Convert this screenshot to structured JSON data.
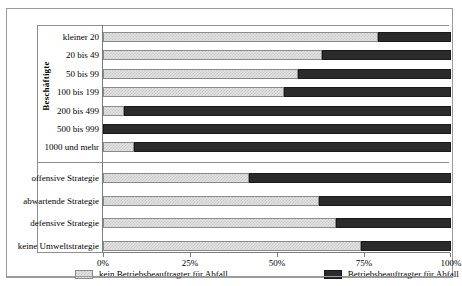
{
  "chart_data": {
    "type": "bar",
    "orientation": "horizontal",
    "stacked": true,
    "title": "",
    "xlabel": "",
    "ylabel": "Beschäftigte",
    "xlim": [
      0,
      100
    ],
    "xticks": [
      "0%",
      "25%",
      "50%",
      "75%",
      "100%"
    ],
    "xtick_values": [
      0,
      25,
      50,
      75,
      100
    ],
    "grid": false,
    "legend_position": "bottom",
    "categories": [
      "kleiner 20",
      "20 bis 49",
      "50 bis 99",
      "100 bis 199",
      "200 bis 499",
      "500 bis 999",
      "1000 und mehr",
      "offensive Strategie",
      "abwartende Strategie",
      "defensive Strategie",
      "keine Umweltstrategie"
    ],
    "group_labels": {
      "upper": "Beschäftigte",
      "lower": ""
    },
    "group_split_after_index": 6,
    "series": [
      {
        "name": "kein Betriebsbeauftragter für Abfall",
        "color": "#e2e2e2",
        "values": [
          79,
          63,
          56,
          52,
          6,
          0,
          9,
          42,
          62,
          67,
          74
        ]
      },
      {
        "name": "Betriebsbeauftragter für Abfall",
        "color": "#2b2b2b",
        "values": [
          21,
          37,
          44,
          48,
          94,
          100,
          91,
          58,
          38,
          33,
          26
        ]
      }
    ]
  },
  "legend": {
    "items": [
      {
        "label": "kein Betriebsbeauftragter für Abfall",
        "swatch": "light-hatched"
      },
      {
        "label": "Betriebsbeauftragter für Abfall",
        "swatch": "solid-dark"
      }
    ]
  },
  "colors": {
    "light": "#e2e2e2",
    "light_hatch": "#c9c9c9",
    "dark": "#2b2b2b",
    "frame": "#9a9a9a",
    "axis": "#7c7c7c"
  }
}
